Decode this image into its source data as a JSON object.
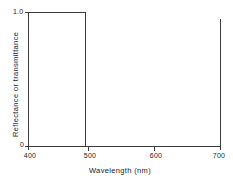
{
  "chart_data": {
    "type": "line",
    "title": "",
    "subtitle": "",
    "xlabel": "Wavelength (nm)",
    "ylabel": "Reflectance or transmittance",
    "xlim": [
      400,
      700
    ],
    "ylim": [
      0,
      1.0
    ],
    "xticks": [
      400,
      500,
      600,
      700
    ],
    "xtick_labels": [
      "400",
      "500",
      "600",
      "700"
    ],
    "yticks": [
      0,
      1.0
    ],
    "ytick_labels": [
      "0",
      "1.0"
    ],
    "grid": false,
    "legend": null,
    "annotations": [],
    "series": [
      {
        "name": "Ideal short-pass filter",
        "x": [
          400,
          490,
          490,
          700
        ],
        "values": [
          1.0,
          1.0,
          0.0,
          0.0
        ]
      }
    ],
    "cutoff_wavelength": 490,
    "line_color": "#3a3a3a",
    "axis_color": "#3a3a3a",
    "background_color": "#ffffff"
  },
  "axis": {
    "x_title": "Wavelength (nm)",
    "y_title": "Reflectance or transmittance",
    "x_labels": [
      "400",
      "500",
      "600",
      "700"
    ],
    "y_label_top": "1.0",
    "y_label_bottom": "0"
  }
}
